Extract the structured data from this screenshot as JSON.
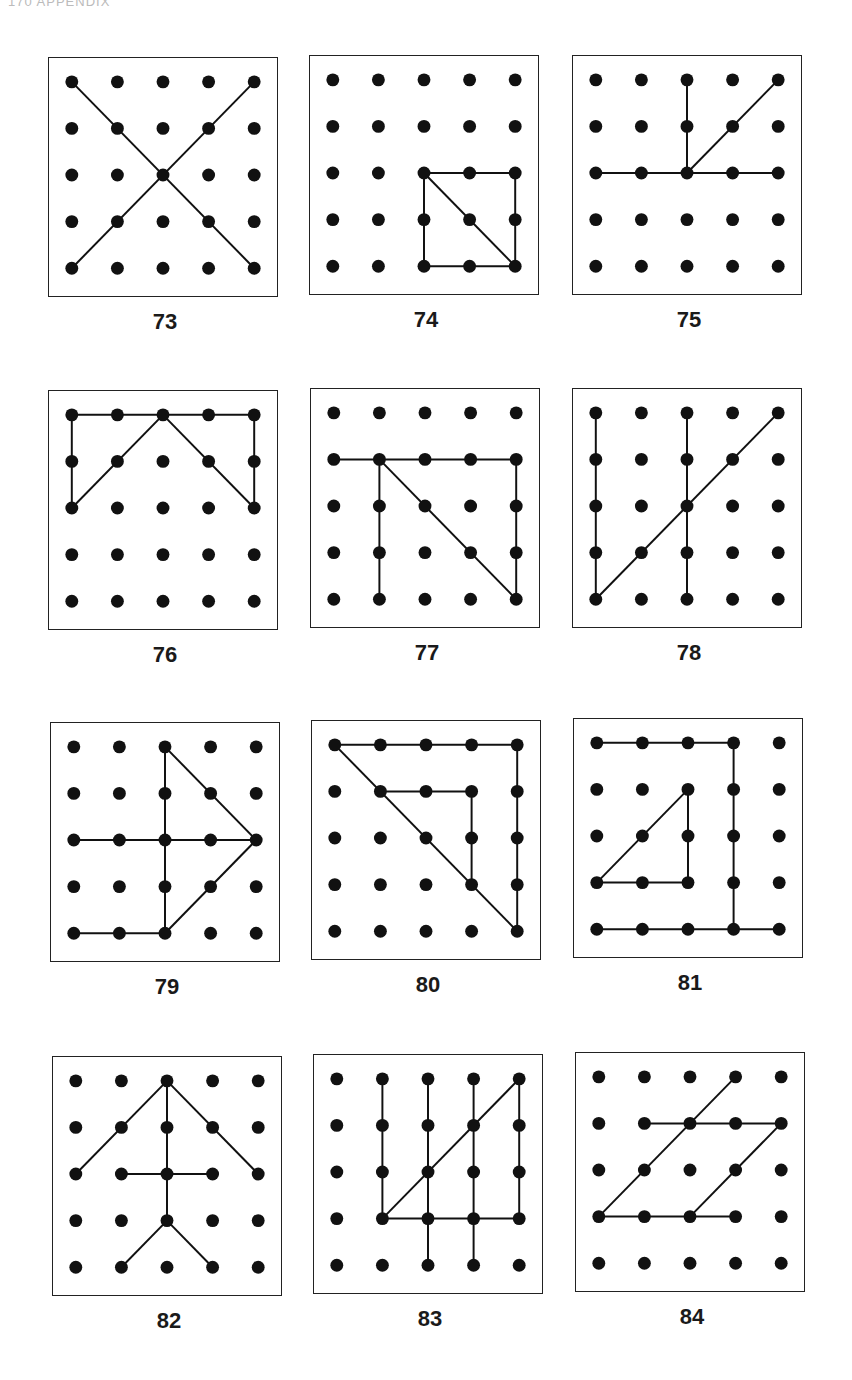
{
  "page": {
    "header": "170  APPENDIX"
  },
  "style": {
    "ink": "#111111",
    "dot_radius": 6.5,
    "line_width": 2
  },
  "figures": [
    {
      "number": "73",
      "segments": [
        [
          0,
          0,
          4,
          4
        ],
        [
          4,
          0,
          0,
          4
        ]
      ]
    },
    {
      "number": "74",
      "segments": [
        [
          2,
          2,
          4,
          2
        ],
        [
          4,
          2,
          4,
          4
        ],
        [
          4,
          4,
          2,
          4
        ],
        [
          2,
          4,
          2,
          2
        ],
        [
          2,
          2,
          4,
          4
        ]
      ]
    },
    {
      "number": "75",
      "segments": [
        [
          2,
          0,
          2,
          2
        ],
        [
          4,
          0,
          2,
          2
        ],
        [
          0,
          2,
          4,
          2
        ]
      ]
    },
    {
      "number": "76",
      "segments": [
        [
          0,
          0,
          4,
          0
        ],
        [
          0,
          0,
          0,
          2
        ],
        [
          4,
          0,
          4,
          2
        ],
        [
          0,
          2,
          2,
          0
        ],
        [
          2,
          0,
          4,
          2
        ]
      ]
    },
    {
      "number": "77",
      "segments": [
        [
          0,
          1,
          4,
          1
        ],
        [
          1,
          1,
          1,
          4
        ],
        [
          1,
          1,
          4,
          4
        ],
        [
          4,
          1,
          4,
          4
        ]
      ]
    },
    {
      "number": "78",
      "segments": [
        [
          0,
          0,
          0,
          4
        ],
        [
          2,
          0,
          2,
          4
        ],
        [
          0,
          4,
          4,
          0
        ]
      ]
    },
    {
      "number": "79",
      "segments": [
        [
          2,
          0,
          2,
          4
        ],
        [
          0,
          2,
          4,
          2
        ],
        [
          2,
          0,
          4,
          2
        ],
        [
          4,
          2,
          2,
          4
        ],
        [
          0,
          4,
          2,
          4
        ]
      ]
    },
    {
      "number": "80",
      "segments": [
        [
          0,
          0,
          4,
          0
        ],
        [
          4,
          0,
          4,
          4
        ],
        [
          0,
          0,
          4,
          4
        ],
        [
          1,
          1,
          3,
          1
        ],
        [
          3,
          1,
          3,
          3
        ]
      ]
    },
    {
      "number": "81",
      "segments": [
        [
          0,
          0,
          3,
          0
        ],
        [
          3,
          0,
          3,
          4
        ],
        [
          0,
          4,
          4,
          4
        ],
        [
          0,
          3,
          2,
          1
        ],
        [
          2,
          1,
          2,
          3
        ],
        [
          0,
          3,
          2,
          3
        ]
      ]
    },
    {
      "number": "82",
      "segments": [
        [
          2,
          0,
          2,
          3
        ],
        [
          2,
          0,
          0,
          2
        ],
        [
          2,
          0,
          4,
          2
        ],
        [
          1,
          2,
          3,
          2
        ],
        [
          2,
          3,
          1,
          4
        ],
        [
          2,
          3,
          3,
          4
        ]
      ]
    },
    {
      "number": "83",
      "segments": [
        [
          1,
          0,
          1,
          3
        ],
        [
          2,
          0,
          2,
          4
        ],
        [
          3,
          0,
          3,
          4
        ],
        [
          4,
          0,
          4,
          3
        ],
        [
          1,
          3,
          4,
          0
        ],
        [
          1,
          3,
          4,
          3
        ]
      ]
    },
    {
      "number": "84",
      "segments": [
        [
          3,
          0,
          0,
          3
        ],
        [
          1,
          1,
          4,
          1
        ],
        [
          4,
          1,
          2,
          3
        ],
        [
          0,
          3,
          3,
          3
        ]
      ]
    }
  ]
}
